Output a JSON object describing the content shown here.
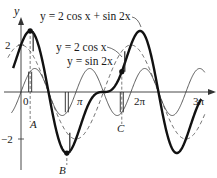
{
  "chart_data": {
    "type": "line",
    "title": "",
    "xlabel": "",
    "ylabel": "y",
    "x_ticks": [
      {
        "value": 0,
        "label": "0"
      },
      {
        "value": 3.14159,
        "label": "π"
      },
      {
        "value": 6.28318,
        "label": "2π"
      },
      {
        "value": 9.42478,
        "label": "3π"
      }
    ],
    "y_ticks": [
      {
        "value": 2,
        "label": "2"
      },
      {
        "value": -2,
        "label": "−2"
      }
    ],
    "xlim": [
      -0.6,
      10.6
    ],
    "ylim": [
      -2.8,
      2.9
    ],
    "grid": false,
    "series": [
      {
        "name": "y = 2 cos x + sin 2x",
        "style": "thick-solid",
        "formula": "2*cos(x)+sin(2*x)"
      },
      {
        "name": "y = 2 cos x",
        "style": "dashed",
        "formula": "2*cos(x)"
      },
      {
        "name": "y = sin 2x",
        "style": "thin-solid",
        "formula": "sin(2*x)"
      }
    ],
    "annotations": [
      {
        "label": "A",
        "x": 0.5236,
        "note": "ordinate addition example"
      },
      {
        "label": "B",
        "x": 2.618,
        "note": "ordinate addition example"
      },
      {
        "label": "C",
        "x": 5.7596,
        "note": "ordinate addition example"
      }
    ],
    "legend": [
      {
        "label": "y = 2 cos x + sin 2x"
      },
      {
        "label": "y = 2 cos x"
      },
      {
        "label": "y = sin 2x"
      }
    ]
  },
  "labels": {
    "y_axis": "y",
    "origin": "0",
    "pi": "π",
    "two_pi": "2π",
    "three_pi": "3π",
    "y_two": "2",
    "y_neg_two": "−2",
    "A": "A",
    "B": "B",
    "C": "C",
    "legend_sum": "y = 2 cos x + sin 2x",
    "legend_cos": "y = 2 cos x",
    "legend_sin": "y = sin 2x"
  }
}
